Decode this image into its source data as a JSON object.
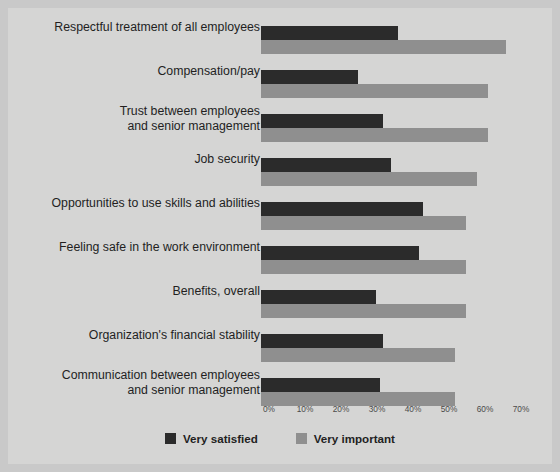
{
  "chart_data": {
    "type": "bar",
    "orientation": "horizontal",
    "title": "",
    "xlabel": "",
    "ylabel": "",
    "xlim": [
      0,
      70
    ],
    "grid": false,
    "legend_position": "bottom",
    "xticks": [
      "0%",
      "10%",
      "20%",
      "30%",
      "40%",
      "50%",
      "60%",
      "70%"
    ],
    "xtick_values": [
      0,
      10,
      20,
      30,
      40,
      50,
      60,
      70
    ],
    "categories": [
      "Respectful treatment of all employees",
      "Compensation/pay",
      "Trust between employees and senior management",
      "Job security",
      "Opportunities to use skills and abilities",
      "Feeling safe in the work environment",
      "Benefits, overall",
      "Organization's financial stability",
      "Communication between employees and senior management"
    ],
    "category_lines": [
      [
        "Respectful treatment of all employees"
      ],
      [
        "Compensation/pay"
      ],
      [
        "Trust between employees",
        "and senior management"
      ],
      [
        "Job security"
      ],
      [
        "Opportunities to use skills and abilities"
      ],
      [
        "Feeling safe in the work environment"
      ],
      [
        "Benefits, overall"
      ],
      [
        "Organization's financial stability"
      ],
      [
        "Communication between employees",
        "and senior management"
      ]
    ],
    "series": [
      {
        "name": "Very satisfied",
        "color": "#2b2b2b",
        "values": [
          38,
          27,
          34,
          36,
          45,
          44,
          32,
          34,
          33
        ]
      },
      {
        "name": "Very important",
        "color": "#8f8f8f",
        "values": [
          68,
          63,
          63,
          60,
          57,
          57,
          57,
          54,
          54
        ]
      }
    ]
  },
  "legend": {
    "items": [
      {
        "label": "Very satisfied",
        "color": "#2b2b2b"
      },
      {
        "label": "Very important",
        "color": "#8f8f8f"
      }
    ]
  },
  "colors": {
    "page_background": "#c9c9c9",
    "panel_background": "#d5d5d4",
    "satisfied": "#2b2b2b",
    "important": "#8f8f8f",
    "text": "#231f1f",
    "tick_text": "#4a4a4a"
  }
}
